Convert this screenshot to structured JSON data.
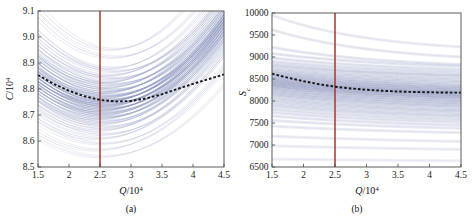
{
  "figure": {
    "title": "",
    "background_color": "#ffffff",
    "panels": [
      "a",
      "b"
    ]
  },
  "chart_data": [
    {
      "type": "line",
      "panel": "a",
      "caption": "(a)",
      "title": "",
      "xlabel": "Q/10^4",
      "xlabel_base": "Q",
      "xlabel_denom": "/10",
      "xlabel_exp": "4",
      "ylabel": "C/10^4",
      "ylabel_base": "C",
      "ylabel_denom": "/10",
      "ylabel_exp": "4",
      "xlim": [
        1.5,
        4.5
      ],
      "ylim": [
        8.5,
        9.1
      ],
      "xticks": [
        1.5,
        2,
        2.5,
        3,
        3.5,
        4,
        4.5
      ],
      "xtick_labels": [
        "1.5",
        "2",
        "2.5",
        "3",
        "3.5",
        "4",
        "4.5"
      ],
      "yticks": [
        8.5,
        8.6,
        8.7,
        8.8,
        8.9,
        9.0,
        9.1
      ],
      "ytick_labels": [
        "8.5",
        "8.6",
        "8.7",
        "8.8",
        "8.9",
        "9.0",
        "9.1"
      ],
      "grid": false,
      "legend": "none",
      "annotations": [
        {
          "name": "optimal-Q-marker",
          "type": "vline",
          "x": 2.5,
          "color": "#A0392F"
        }
      ],
      "mean_curve": {
        "name": "mean-dashed-curve",
        "style": "dashed",
        "color": "#141414",
        "x": [
          1.5,
          1.75,
          2.0,
          2.25,
          2.5,
          2.75,
          3.0,
          3.25,
          3.5,
          3.75,
          4.0,
          4.25,
          4.5
        ],
        "y": [
          8.854,
          8.82,
          8.793,
          8.772,
          8.758,
          8.752,
          8.754,
          8.764,
          8.78,
          8.8,
          8.82,
          8.838,
          8.856
        ]
      },
      "ensemble": {
        "name": "cost-sample-curves",
        "n_curves": 80,
        "color_range": [
          "#7b85b4",
          "#c3c9de"
        ],
        "description": "ensemble of U-shaped total-cost curves, minima clustered near Q=2.5-2.9, spread 8.55-9.10",
        "y_at_x_min": [
          8.55,
          9.1
        ],
        "bands": [
          {
            "y0": 9.065,
            "ymin": 8.952,
            "xmin": 2.7,
            "curv": 0.116
          },
          {
            "y0": 9.02,
            "ymin": 8.922,
            "xmin": 2.72,
            "curv": 0.104
          },
          {
            "y0": 8.972,
            "ymin": 8.88,
            "xmin": 2.66,
            "curv": 0.098
          },
          {
            "y0": 8.958,
            "ymin": 8.868,
            "xmin": 2.74,
            "curv": 0.094
          },
          {
            "y0": 8.94,
            "ymin": 8.852,
            "xmin": 2.62,
            "curv": 0.092
          },
          {
            "y0": 8.926,
            "ymin": 8.84,
            "xmin": 2.7,
            "curv": 0.09
          },
          {
            "y0": 8.912,
            "ymin": 8.826,
            "xmin": 2.58,
            "curv": 0.09
          },
          {
            "y0": 8.9,
            "ymin": 8.818,
            "xmin": 2.68,
            "curv": 0.086
          },
          {
            "y0": 8.89,
            "ymin": 8.806,
            "xmin": 2.6,
            "curv": 0.088
          },
          {
            "y0": 8.878,
            "ymin": 8.796,
            "xmin": 2.66,
            "curv": 0.086
          },
          {
            "y0": 8.868,
            "ymin": 8.786,
            "xmin": 2.56,
            "curv": 0.086
          },
          {
            "y0": 8.858,
            "ymin": 8.776,
            "xmin": 2.64,
            "curv": 0.086
          },
          {
            "y0": 8.848,
            "ymin": 8.768,
            "xmin": 2.58,
            "curv": 0.084
          },
          {
            "y0": 8.84,
            "ymin": 8.758,
            "xmin": 2.62,
            "curv": 0.086
          },
          {
            "y0": 8.83,
            "ymin": 8.75,
            "xmin": 2.54,
            "curv": 0.084
          },
          {
            "y0": 8.822,
            "ymin": 8.742,
            "xmin": 2.6,
            "curv": 0.084
          },
          {
            "y0": 8.814,
            "ymin": 8.734,
            "xmin": 2.56,
            "curv": 0.084
          },
          {
            "y0": 8.806,
            "ymin": 8.726,
            "xmin": 2.62,
            "curv": 0.084
          },
          {
            "y0": 8.798,
            "ymin": 8.718,
            "xmin": 2.52,
            "curv": 0.084
          },
          {
            "y0": 8.79,
            "ymin": 8.71,
            "xmin": 2.58,
            "curv": 0.084
          },
          {
            "y0": 8.782,
            "ymin": 8.702,
            "xmin": 2.54,
            "curv": 0.084
          },
          {
            "y0": 8.774,
            "ymin": 8.694,
            "xmin": 2.6,
            "curv": 0.084
          },
          {
            "y0": 8.766,
            "ymin": 8.686,
            "xmin": 2.5,
            "curv": 0.084
          },
          {
            "y0": 8.756,
            "ymin": 8.676,
            "xmin": 2.56,
            "curv": 0.084
          },
          {
            "y0": 8.746,
            "ymin": 8.666,
            "xmin": 2.52,
            "curv": 0.084
          },
          {
            "y0": 8.734,
            "ymin": 8.654,
            "xmin": 2.58,
            "curv": 0.084
          },
          {
            "y0": 8.72,
            "ymin": 8.642,
            "xmin": 2.5,
            "curv": 0.082
          },
          {
            "y0": 8.704,
            "ymin": 8.626,
            "xmin": 2.56,
            "curv": 0.082
          },
          {
            "y0": 8.686,
            "ymin": 8.61,
            "xmin": 2.48,
            "curv": 0.08
          },
          {
            "y0": 8.664,
            "ymin": 8.59,
            "xmin": 2.54,
            "curv": 0.078
          },
          {
            "y0": 8.636,
            "ymin": 8.566,
            "xmin": 2.46,
            "curv": 0.074
          },
          {
            "y0": 8.606,
            "ymin": 8.54,
            "xmin": 2.52,
            "curv": 0.07
          }
        ]
      }
    },
    {
      "type": "line",
      "panel": "b",
      "caption": "(b)",
      "title": "",
      "xlabel": "Q/10^4",
      "xlabel_base": "Q",
      "xlabel_denom": "/10",
      "xlabel_exp": "4",
      "ylabel": "S_c",
      "ylabel_base": "S",
      "ylabel_sub": "c",
      "xlim": [
        1.5,
        4.5
      ],
      "ylim": [
        6500,
        10000
      ],
      "xticks": [
        1.5,
        2,
        2.5,
        3,
        3.5,
        4,
        4.5
      ],
      "xtick_labels": [
        "1.5",
        "2",
        "2.5",
        "3",
        "3.5",
        "4",
        "4.5"
      ],
      "yticks": [
        6500,
        7000,
        7500,
        8000,
        8500,
        9000,
        9500,
        10000
      ],
      "ytick_labels": [
        "6500",
        "7000",
        "7500",
        "8000",
        "8500",
        "9000",
        "9500",
        "10000"
      ],
      "grid": false,
      "legend": "none",
      "annotations": [
        {
          "name": "optimal-Q-marker",
          "type": "vline",
          "x": 2.5,
          "color": "#A0392F"
        }
      ],
      "mean_curve": {
        "name": "mean-dashed-curve",
        "style": "dashed",
        "color": "#141414",
        "x": [
          1.5,
          1.75,
          2.0,
          2.25,
          2.5,
          2.75,
          3.0,
          3.25,
          3.5,
          3.75,
          4.0,
          4.25,
          4.5
        ],
        "y": [
          8620,
          8530,
          8450,
          8380,
          8325,
          8285,
          8255,
          8232,
          8215,
          8205,
          8198,
          8192,
          8190
        ]
      },
      "ensemble": {
        "name": "reorder-point-sample-curves",
        "n_curves": 80,
        "color_range": [
          "#7b85b4",
          "#c3c9de"
        ],
        "description": "ensemble of monotonically decreasing reorder-point curves, spread 6600-9950 at Q=1.5 narrowing slightly toward Q=4.5",
        "bands": [
          {
            "y0": 9950,
            "y1": 9230,
            "k": 0.62
          },
          {
            "y0": 9620,
            "y1": 9000,
            "k": 0.58
          },
          {
            "y0": 9220,
            "y1": 8830,
            "k": 0.52
          },
          {
            "y0": 9080,
            "y1": 8790,
            "k": 0.48
          },
          {
            "y0": 8980,
            "y1": 8720,
            "k": 0.48
          },
          {
            "y0": 8900,
            "y1": 8660,
            "k": 0.46
          },
          {
            "y0": 8840,
            "y1": 8600,
            "k": 0.46
          },
          {
            "y0": 8790,
            "y1": 8560,
            "k": 0.44
          },
          {
            "y0": 8730,
            "y1": 8500,
            "k": 0.44
          },
          {
            "y0": 8680,
            "y1": 8440,
            "k": 0.44
          },
          {
            "y0": 8640,
            "y1": 8380,
            "k": 0.44
          },
          {
            "y0": 8600,
            "y1": 8330,
            "k": 0.44
          },
          {
            "y0": 8560,
            "y1": 8290,
            "k": 0.44
          },
          {
            "y0": 8520,
            "y1": 8250,
            "k": 0.44
          },
          {
            "y0": 8480,
            "y1": 8210,
            "k": 0.44
          },
          {
            "y0": 8440,
            "y1": 8180,
            "k": 0.44
          },
          {
            "y0": 8400,
            "y1": 8140,
            "k": 0.44
          },
          {
            "y0": 8360,
            "y1": 8100,
            "k": 0.44
          },
          {
            "y0": 8320,
            "y1": 8060,
            "k": 0.44
          },
          {
            "y0": 8270,
            "y1": 8010,
            "k": 0.44
          },
          {
            "y0": 8220,
            "y1": 7960,
            "k": 0.44
          },
          {
            "y0": 8170,
            "y1": 7910,
            "k": 0.44
          },
          {
            "y0": 8120,
            "y1": 7860,
            "k": 0.44
          },
          {
            "y0": 8060,
            "y1": 7800,
            "k": 0.44
          },
          {
            "y0": 8000,
            "y1": 7750,
            "k": 0.44
          },
          {
            "y0": 7940,
            "y1": 7690,
            "k": 0.44
          },
          {
            "y0": 7880,
            "y1": 7640,
            "k": 0.42
          },
          {
            "y0": 7810,
            "y1": 7580,
            "k": 0.42
          },
          {
            "y0": 7740,
            "y1": 7520,
            "k": 0.42
          },
          {
            "y0": 7660,
            "y1": 7450,
            "k": 0.4
          },
          {
            "y0": 7560,
            "y1": 7380,
            "k": 0.38
          },
          {
            "y0": 7430,
            "y1": 7280,
            "k": 0.34
          },
          {
            "y0": 7200,
            "y1": 7080,
            "k": 0.28
          },
          {
            "y0": 6980,
            "y1": 6900,
            "k": 0.22
          },
          {
            "y0": 6680,
            "y1": 6640,
            "k": 0.16
          }
        ]
      }
    }
  ],
  "colors": {
    "curve_dark": "#7b85b4",
    "curve_light": "#c3c9de",
    "mean_dash": "#141414",
    "vline": "#A0392F",
    "frame": "#4a4a4a",
    "text": "#111111",
    "background": "#ffffff"
  }
}
